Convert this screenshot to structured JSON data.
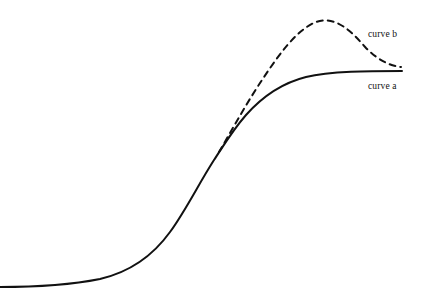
{
  "figure": {
    "name": "two-curve-comparison-diagram",
    "width": 422,
    "height": 301,
    "background_color": "#ffffff",
    "stroke_color": "#111111",
    "stroke_width": 2,
    "top_cropped_text": ""
  },
  "labels": {
    "curve_a": "curve a",
    "curve_b": "curve b"
  },
  "chart_data": {
    "type": "line",
    "title": "",
    "subtitle": "",
    "xlabel": "",
    "ylabel": "",
    "xlim": [
      0,
      422
    ],
    "ylim": [
      301,
      0
    ],
    "grid": false,
    "axes_visible": false,
    "tick_labels": {
      "x": [],
      "y": []
    },
    "legend": {
      "position": "inline-right",
      "entries": [
        {
          "name": "curve b",
          "style": "dashed"
        },
        {
          "name": "curve a",
          "style": "solid"
        }
      ]
    },
    "annotations": [
      {
        "text": "curve b",
        "x": 368,
        "y": 34,
        "anchor": "start"
      },
      {
        "text": "curve a",
        "x": 368,
        "y": 86,
        "anchor": "start"
      }
    ],
    "series": [
      {
        "name": "curve a",
        "style": "solid",
        "stroke": "#111111",
        "stroke_width": 2,
        "description": "sigmoid / logistic saturating growth curve",
        "path": "M 0,287 C 40,287 70,285 100,279 C 130,272 152,257 170,232 C 186,210 198,185 214,160 C 222,148 232,131 246,115 C 262,97 282,83 306,77 C 330,71 370,71 402,71",
        "points": [
          {
            "x": 0,
            "y": 287
          },
          {
            "x": 40,
            "y": 287
          },
          {
            "x": 70,
            "y": 285
          },
          {
            "x": 100,
            "y": 279
          },
          {
            "x": 130,
            "y": 272
          },
          {
            "x": 152,
            "y": 257
          },
          {
            "x": 170,
            "y": 232
          },
          {
            "x": 185,
            "y": 210
          },
          {
            "x": 200,
            "y": 182
          },
          {
            "x": 214,
            "y": 160
          },
          {
            "x": 222,
            "y": 148
          },
          {
            "x": 246,
            "y": 115
          },
          {
            "x": 270,
            "y": 95
          },
          {
            "x": 306,
            "y": 77
          },
          {
            "x": 340,
            "y": 72
          },
          {
            "x": 402,
            "y": 71
          }
        ]
      },
      {
        "name": "curve b",
        "style": "dashed",
        "stroke": "#111111",
        "stroke_width": 2,
        "dash_pattern": "6 5",
        "description": "branches from curve a, peaks then declines back toward the curve a plateau",
        "path": "M 219,152 C 232,130 246,104 262,80 C 278,56 296,30 316,22 C 336,15 352,32 366,48 C 378,60 390,66 401,67",
        "points": [
          {
            "x": 219,
            "y": 152
          },
          {
            "x": 240,
            "y": 116
          },
          {
            "x": 262,
            "y": 80
          },
          {
            "x": 285,
            "y": 48
          },
          {
            "x": 302,
            "y": 29
          },
          {
            "x": 316,
            "y": 22
          },
          {
            "x": 332,
            "y": 25
          },
          {
            "x": 350,
            "y": 40
          },
          {
            "x": 366,
            "y": 52
          },
          {
            "x": 384,
            "y": 62
          },
          {
            "x": 401,
            "y": 67
          }
        ],
        "branch_point": {
          "x": 219,
          "y": 152
        },
        "peak": {
          "x": 316,
          "y": 22
        }
      }
    ]
  }
}
